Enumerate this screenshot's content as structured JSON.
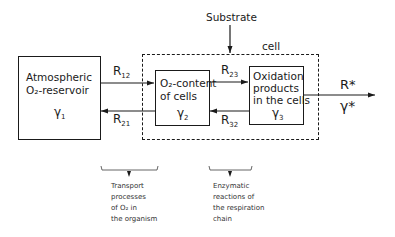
{
  "diagram": {
    "substrate_label": "Substrate",
    "cell_label": "cell",
    "compartments": [
      {
        "id": "atmospheric",
        "lines": [
          "Atmospheric",
          "O₂-reservoir"
        ],
        "symbol": "γ",
        "index": "1"
      },
      {
        "id": "cells",
        "lines": [
          "O₂-content",
          "of cells"
        ],
        "symbol": "γ",
        "index": "2"
      },
      {
        "id": "oxidation",
        "lines": [
          "Oxidation",
          "products",
          "in the cells"
        ],
        "symbol": "γ",
        "index": "3"
      }
    ],
    "rates": {
      "r12": {
        "base": "R",
        "sub": "12"
      },
      "r21": {
        "base": "R",
        "sub": "21"
      },
      "r23": {
        "base": "R",
        "sub": "23"
      },
      "r32": {
        "base": "R",
        "sub": "32"
      }
    },
    "output": {
      "rate": "R*",
      "symbol": "γ*"
    },
    "annotations": [
      {
        "id": "transport",
        "lines": [
          "Transport",
          "processes",
          "of O₂ in",
          "the organism"
        ]
      },
      {
        "id": "enzymatic",
        "lines": [
          "Enzymatic",
          "reactions of",
          "the respiration",
          "chain"
        ]
      }
    ]
  }
}
